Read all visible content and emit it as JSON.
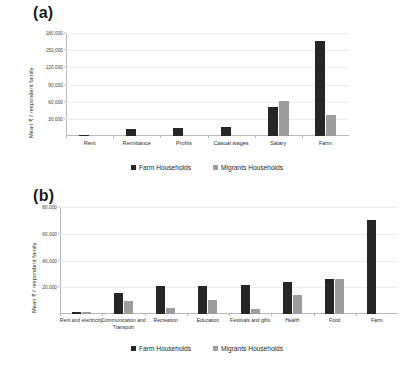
{
  "figure": {
    "panels": [
      {
        "label": "(a)",
        "ylabel": "Mean ₹ / respondent family",
        "legend": [
          "Farm Households",
          "Migrants Households"
        ]
      },
      {
        "label": "(b)",
        "ylabel": "Mean ₹ / respondent family",
        "legend": [
          "Farm Households",
          "Migrants Households"
        ]
      }
    ],
    "colors": {
      "farm_households": "#262626",
      "migrants_households": "#9d9d9d",
      "gridline": "#ececec",
      "axis": "#b9b9b9"
    }
  },
  "chart_data": [
    {
      "type": "bar",
      "title": "(a)",
      "xlabel": "",
      "ylabel": "Mean ₹ / respondent family",
      "categories": [
        "Rent",
        "Remittance",
        "Profits",
        "Casual wages",
        "Salary",
        "Farm"
      ],
      "series": [
        {
          "name": "Farm Households",
          "values": [
            2500,
            13000,
            14000,
            15500,
            50000,
            166000
          ]
        },
        {
          "name": "Migrants Households",
          "values": [
            0,
            0,
            0,
            0,
            61000,
            37000
          ]
        }
      ],
      "ylim": [
        0,
        180000
      ],
      "yticks": [
        30000,
        60000,
        90000,
        120000,
        150000,
        180000
      ],
      "ytick_labels": [
        "30,000",
        "60,000",
        "90,000",
        "120,000",
        "150,000",
        "180,000"
      ],
      "grid": true,
      "legend_position": "bottom"
    },
    {
      "type": "bar",
      "title": "(b)",
      "xlabel": "",
      "ylabel": "Mean ₹ / respondent family",
      "categories": [
        "Rent and electricity",
        "Communication and Transport",
        "Recreation",
        "Education",
        "Festivals and gifts",
        "Health",
        "Food",
        "Farm"
      ],
      "series": [
        {
          "name": "Farm Households",
          "values": [
            1200,
            16000,
            21000,
            21000,
            21500,
            24000,
            26500,
            70000
          ]
        },
        {
          "name": "Migrants Households",
          "values": [
            1800,
            10000,
            4500,
            10500,
            4000,
            14500,
            26000,
            0
          ]
        }
      ],
      "ylim": [
        0,
        80000
      ],
      "yticks": [
        20000,
        40000,
        60000,
        80000
      ],
      "ytick_labels": [
        "20,000",
        "40,000",
        "60,000",
        "80,000"
      ],
      "grid": true,
      "legend_position": "bottom"
    }
  ]
}
